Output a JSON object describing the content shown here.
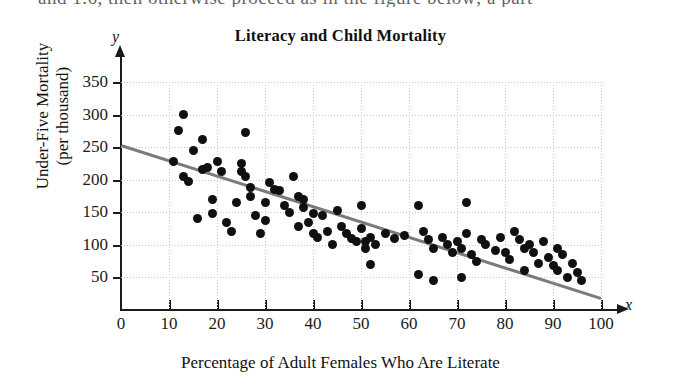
{
  "page": {
    "bleed_text_above": "and 1.6, then otherwise proceed as in the figure below; a part"
  },
  "chart_data": {
    "type": "scatter",
    "title": "Literacy and Child Mortality",
    "xlabel": "Percentage of Adult Females Who Are Literate",
    "ylabel_line1": "Under-Five Mortality",
    "ylabel_line2": "(per thousand)",
    "x_axis_letter": "x",
    "y_axis_letter": "y",
    "xlim": [
      0,
      100
    ],
    "ylim": [
      0,
      350
    ],
    "xticks": [
      0,
      10,
      20,
      30,
      40,
      50,
      60,
      70,
      80,
      90,
      100
    ],
    "yticks": [
      50,
      100,
      150,
      200,
      250,
      300,
      350
    ],
    "grid": true,
    "legend": "none",
    "marker_color": "#101010",
    "trendline": {
      "label": "least-squares regression line",
      "color": "#7b7b7b",
      "x_start": 0,
      "y_start": 255,
      "x_end": 100,
      "y_end": 20,
      "slope": -2.35,
      "intercept": 255
    },
    "points": [
      [
        13,
        300
      ],
      [
        12,
        275
      ],
      [
        17,
        262
      ],
      [
        26,
        272
      ],
      [
        15,
        245
      ],
      [
        11,
        228
      ],
      [
        13,
        205
      ],
      [
        14,
        198
      ],
      [
        17,
        215
      ],
      [
        18,
        218
      ],
      [
        20,
        228
      ],
      [
        21,
        213
      ],
      [
        19,
        170
      ],
      [
        16,
        140
      ],
      [
        19,
        148
      ],
      [
        22,
        135
      ],
      [
        23,
        120
      ],
      [
        25,
        225
      ],
      [
        25,
        212
      ],
      [
        26,
        205
      ],
      [
        27,
        188
      ],
      [
        27,
        175
      ],
      [
        24,
        165
      ],
      [
        28,
        145
      ],
      [
        30,
        165
      ],
      [
        30,
        138
      ],
      [
        29,
        118
      ],
      [
        31,
        195
      ],
      [
        32,
        185
      ],
      [
        33,
        183
      ],
      [
        34,
        160
      ],
      [
        35,
        150
      ],
      [
        36,
        205
      ],
      [
        37,
        175
      ],
      [
        38,
        170
      ],
      [
        38,
        158
      ],
      [
        37,
        128
      ],
      [
        39,
        135
      ],
      [
        40,
        148
      ],
      [
        40,
        118
      ],
      [
        41,
        112
      ],
      [
        42,
        145
      ],
      [
        43,
        120
      ],
      [
        44,
        100
      ],
      [
        45,
        152
      ],
      [
        46,
        128
      ],
      [
        47,
        118
      ],
      [
        48,
        110
      ],
      [
        49,
        105
      ],
      [
        50,
        160
      ],
      [
        50,
        125
      ],
      [
        51,
        105
      ],
      [
        51,
        95
      ],
      [
        52,
        112
      ],
      [
        52,
        70
      ],
      [
        53,
        100
      ],
      [
        55,
        118
      ],
      [
        57,
        110
      ],
      [
        59,
        115
      ],
      [
        62,
        160
      ],
      [
        62,
        55
      ],
      [
        63,
        120
      ],
      [
        64,
        108
      ],
      [
        65,
        95
      ],
      [
        65,
        45
      ],
      [
        67,
        112
      ],
      [
        68,
        100
      ],
      [
        69,
        88
      ],
      [
        70,
        105
      ],
      [
        71,
        95
      ],
      [
        71,
        50
      ],
      [
        72,
        118
      ],
      [
        72,
        165
      ],
      [
        73,
        85
      ],
      [
        74,
        75
      ],
      [
        75,
        108
      ],
      [
        76,
        100
      ],
      [
        78,
        92
      ],
      [
        79,
        112
      ],
      [
        80,
        88
      ],
      [
        81,
        78
      ],
      [
        82,
        120
      ],
      [
        83,
        108
      ],
      [
        84,
        95
      ],
      [
        84,
        60
      ],
      [
        85,
        100
      ],
      [
        86,
        88
      ],
      [
        87,
        72
      ],
      [
        88,
        105
      ],
      [
        89,
        80
      ],
      [
        90,
        68
      ],
      [
        91,
        95
      ],
      [
        91,
        60
      ],
      [
        92,
        85
      ],
      [
        93,
        50
      ],
      [
        94,
        72
      ],
      [
        95,
        58
      ],
      [
        96,
        45
      ]
    ]
  }
}
